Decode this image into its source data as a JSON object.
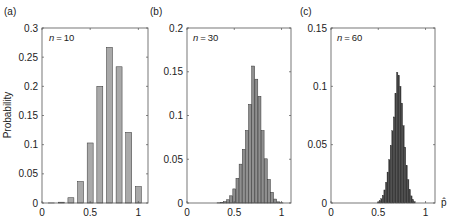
{
  "figure": {
    "x_axis_symbol": "p̂",
    "y_axis_label": "Probability"
  },
  "chart_data": [
    {
      "type": "bar",
      "panel_label": "(a)",
      "annotation": "n = 10",
      "n": 10,
      "ylabel": "Probability",
      "xlabel": "",
      "xlim": [
        0,
        1.1
      ],
      "ylim": [
        0,
        0.3
      ],
      "xticks": [
        0,
        0.5,
        1
      ],
      "xtick_labels": [
        "0",
        "0.5",
        "1"
      ],
      "yticks": [
        0,
        0.05,
        0.1,
        0.15,
        0.2,
        0.25,
        0.3
      ],
      "ytick_labels": [
        "0",
        "0.05",
        "0.1",
        "0.15",
        "0.2",
        "0.25",
        "0.3"
      ],
      "bar_color": "#a9a9a9",
      "x": [
        0,
        0.1,
        0.2,
        0.3,
        0.4,
        0.5,
        0.6,
        0.7,
        0.8,
        0.9,
        1.0
      ],
      "values": [
        0.0,
        0.0001,
        0.0014,
        0.009,
        0.0368,
        0.1029,
        0.2001,
        0.2668,
        0.2335,
        0.1211,
        0.0282
      ]
    },
    {
      "type": "bar",
      "panel_label": "(b)",
      "annotation": "n = 30",
      "n": 30,
      "ylabel": "",
      "xlabel": "",
      "xlim": [
        0,
        1.1
      ],
      "ylim": [
        0,
        0.2
      ],
      "xticks": [
        0,
        0.5,
        1
      ],
      "xtick_labels": [
        "0",
        "0.5",
        "1"
      ],
      "yticks": [
        0,
        0.05,
        0.1,
        0.15,
        0.2
      ],
      "ytick_labels": [
        "0",
        "0.05",
        "0.1",
        "0.15",
        "0.2"
      ],
      "bar_color": "#8f8f8f",
      "x": [
        0.3333,
        0.3667,
        0.4,
        0.4333,
        0.4667,
        0.5,
        0.5333,
        0.5667,
        0.6,
        0.6333,
        0.6667,
        0.7,
        0.7333,
        0.7667,
        0.8,
        0.8333,
        0.8667,
        0.9,
        0.9333,
        0.9667,
        1.0
      ],
      "values": [
        0.0002,
        0.0006,
        0.0015,
        0.0037,
        0.0082,
        0.0161,
        0.0282,
        0.0444,
        0.0613,
        0.0829,
        0.1127,
        0.1565,
        0.1415,
        0.1219,
        0.0828,
        0.0505,
        0.0269,
        0.0122,
        0.0045,
        0.0013,
        0.0002
      ]
    },
    {
      "type": "bar",
      "panel_label": "(c)",
      "annotation": "n = 60",
      "n": 60,
      "ylabel": "",
      "xlabel": "p̂",
      "xlim": [
        0,
        1.1
      ],
      "ylim": [
        0,
        0.15
      ],
      "xticks": [
        0,
        0.5,
        1
      ],
      "xtick_labels": [
        "0",
        "0.5",
        "1"
      ],
      "yticks": [
        0,
        0.05,
        0.1,
        0.15
      ],
      "ytick_labels": [
        "0",
        "0.05",
        "0.1",
        "0.15"
      ],
      "bar_color": "#3a3a3a",
      "x": [
        0.5,
        0.5167,
        0.5333,
        0.55,
        0.5667,
        0.5833,
        0.6,
        0.6167,
        0.6333,
        0.65,
        0.6667,
        0.6833,
        0.7,
        0.7167,
        0.7333,
        0.75,
        0.7667,
        0.7833,
        0.8,
        0.8167,
        0.8333,
        0.85,
        0.8667,
        0.8833
      ],
      "values": [
        0.0009,
        0.0019,
        0.0037,
        0.0066,
        0.0112,
        0.0178,
        0.0265,
        0.0372,
        0.0494,
        0.062,
        0.0738,
        0.0939,
        0.1121,
        0.1095,
        0.1001,
        0.0856,
        0.0664,
        0.0479,
        0.0322,
        0.0201,
        0.0115,
        0.0061,
        0.003,
        0.0013
      ]
    }
  ]
}
